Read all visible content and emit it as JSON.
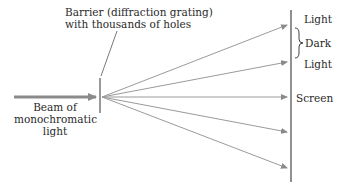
{
  "diagram": {
    "barrier_label_line1": "Barrier (diffraction grating)",
    "barrier_label_line2": "with thousands of holes",
    "beam_label_line1": "Beam of",
    "beam_label_line2": "monochromatic",
    "beam_label_line3": "light",
    "screen_labels": {
      "light_top": "Light",
      "dark": "Dark",
      "light_second": "Light",
      "screen": "Screen"
    },
    "colors": {
      "beam": "#8a8a8a",
      "rays": "#9a9a9a",
      "screen": "#555555",
      "text": "#2a2a2a"
    }
  }
}
